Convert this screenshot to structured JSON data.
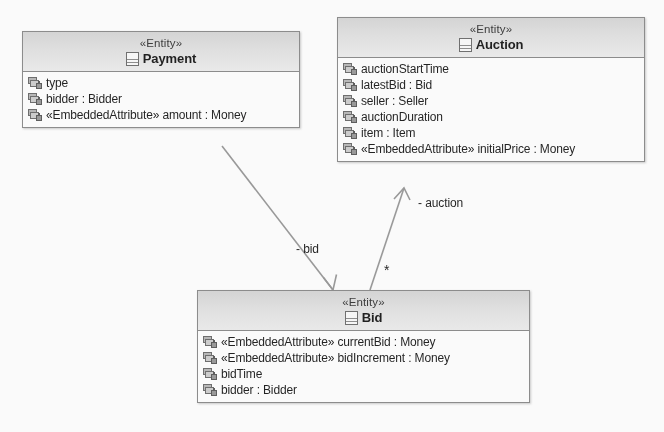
{
  "diagram": {
    "type": "uml-class-diagram",
    "background": "#ffffff",
    "line_color": "#9a9a9a",
    "header_fill": "#e3e3e3",
    "border_color": "#8c8c8c"
  },
  "classes": [
    {
      "id": "payment",
      "stereotype": "«Entity»",
      "name": "Payment",
      "icon": "class-icon",
      "attributes": [
        {
          "icon": "private-attribute-icon",
          "text": "type"
        },
        {
          "icon": "private-attribute-icon",
          "text": "bidder : Bidder"
        },
        {
          "icon": "private-attribute-icon",
          "text": "«EmbeddedAttribute» amount : Money"
        }
      ]
    },
    {
      "id": "auction",
      "stereotype": "«Entity»",
      "name": "Auction",
      "icon": "class-icon",
      "attributes": [
        {
          "icon": "private-attribute-icon",
          "text": "auctionStartTime"
        },
        {
          "icon": "private-attribute-icon",
          "text": "latestBid : Bid"
        },
        {
          "icon": "private-attribute-icon",
          "text": "seller : Seller"
        },
        {
          "icon": "private-attribute-icon",
          "text": "auctionDuration"
        },
        {
          "icon": "private-attribute-icon",
          "text": "item : Item"
        },
        {
          "icon": "private-attribute-icon",
          "text": "«EmbeddedAttribute» initialPrice : Money"
        }
      ]
    },
    {
      "id": "bid",
      "stereotype": "«Entity»",
      "name": "Bid",
      "icon": "class-icon",
      "attributes": [
        {
          "icon": "private-attribute-icon",
          "text": "«EmbeddedAttribute» currentBid : Money"
        },
        {
          "icon": "private-attribute-icon",
          "text": "«EmbeddedAttribute» bidIncrement : Money"
        },
        {
          "icon": "private-attribute-icon",
          "text": "bidTime"
        },
        {
          "icon": "private-attribute-icon",
          "text": "bidder : Bidder"
        }
      ]
    }
  ],
  "associations": [
    {
      "id": "payment-bid",
      "from": "payment",
      "to": "bid",
      "role_label": "- bid",
      "multiplicity": "",
      "arrow": "open"
    },
    {
      "id": "bid-auction",
      "from": "bid",
      "to": "auction",
      "role_label": "- auction",
      "multiplicity": "*",
      "arrow": "open"
    }
  ]
}
